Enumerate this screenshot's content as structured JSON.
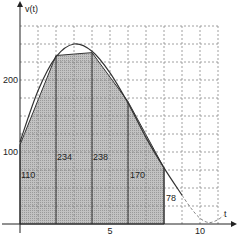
{
  "chart_data": {
    "type": "area",
    "title": "",
    "xlabel": "t",
    "ylabel": "v(t)",
    "xlim": [
      0,
      11
    ],
    "ylim": [
      0,
      275
    ],
    "grid": true,
    "grid_step_x": 1,
    "grid_step_y": 25,
    "x_tick_labels": [
      {
        "value": 5,
        "label": "5"
      },
      {
        "value": 10,
        "label": "10"
      }
    ],
    "y_tick_labels": [
      {
        "value": 100,
        "label": "100"
      },
      {
        "value": 200,
        "label": "200"
      }
    ],
    "trapezoids": {
      "x": [
        0,
        2,
        4,
        6,
        8
      ],
      "values": [
        110,
        234,
        238,
        170,
        78
      ],
      "labels": [
        "110",
        "234",
        "238",
        "170",
        "78"
      ]
    },
    "curve": {
      "description": "smooth velocity curve v(t), peak near t=3",
      "points": [
        [
          0,
          114
        ],
        [
          1,
          185
        ],
        [
          2,
          232
        ],
        [
          3,
          250
        ],
        [
          4,
          240
        ],
        [
          5,
          210
        ],
        [
          6,
          168
        ],
        [
          7,
          120
        ],
        [
          8,
          78
        ],
        [
          9,
          40
        ]
      ],
      "dashed_points": [
        [
          9,
          40
        ],
        [
          9.5,
          22
        ],
        [
          10,
          8
        ],
        [
          10.5,
          2
        ],
        [
          11,
          6
        ],
        [
          11.3,
          12
        ]
      ]
    },
    "legend": null,
    "colors": {
      "fill": "#b4b4b4",
      "line": "#333333",
      "grid": "#888888"
    }
  }
}
